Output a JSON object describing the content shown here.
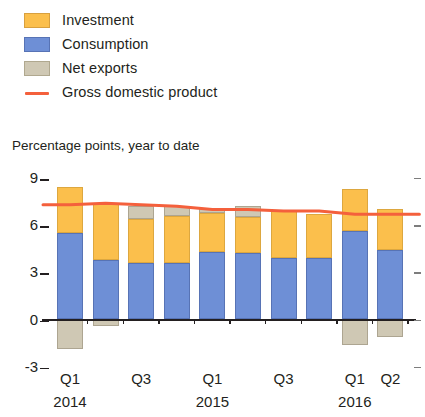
{
  "legend": {
    "items": [
      {
        "label": "Investment",
        "type": "swatch",
        "color": "#fbbf4c",
        "icon": "square-swatch-icon"
      },
      {
        "label": "Consumption",
        "type": "swatch",
        "color": "#6e8fd6",
        "icon": "square-swatch-icon"
      },
      {
        "label": "Net exports",
        "type": "swatch",
        "color": "#cfc8b4",
        "icon": "square-swatch-icon"
      },
      {
        "label": "Gross domestic product",
        "type": "line",
        "color": "#f4603c",
        "icon": "line-swatch-icon"
      }
    ]
  },
  "chart_data": {
    "type": "bar",
    "stacked": true,
    "title": "",
    "subtitle": "",
    "ylabel": "Percentage points, year to date",
    "xlabel": "",
    "ylim": [
      -3,
      9
    ],
    "yticks": [
      9,
      6,
      3,
      0,
      -3
    ],
    "ytick_labels": [
      "9",
      "6",
      "3",
      "0",
      "-3"
    ],
    "grid": false,
    "legend_position": "top-left",
    "categories": [
      "Q1",
      "Q2",
      "Q3",
      "Q4",
      "Q1",
      "Q2",
      "Q3",
      "Q4",
      "Q1",
      "Q2"
    ],
    "x_tick_labels": [
      "Q1",
      "Q3",
      "Q1",
      "Q3",
      "Q1",
      "Q2"
    ],
    "x_tick_indices": [
      0,
      2,
      4,
      6,
      8,
      9
    ],
    "year_labels": [
      "2014",
      "2015",
      "2016"
    ],
    "year_label_indices": [
      0,
      4,
      8
    ],
    "series": [
      {
        "name": "Consumption",
        "color": "#6e8fd6",
        "values": [
          5.5,
          3.8,
          3.6,
          3.6,
          4.3,
          4.2,
          3.9,
          3.9,
          5.6,
          4.4
        ]
      },
      {
        "name": "Investment",
        "color": "#fbbf4c",
        "values": [
          2.9,
          3.6,
          2.8,
          3.0,
          2.5,
          2.3,
          3.0,
          2.8,
          2.7,
          2.6
        ]
      },
      {
        "name": "Net exports",
        "color": "#cfc8b4",
        "values": [
          -1.9,
          -0.4,
          0.8,
          0.6,
          0.3,
          0.7,
          0.0,
          0.0,
          -1.6,
          -1.1
        ]
      }
    ],
    "line_series": {
      "name": "Gross domestic product",
      "color": "#f4603c",
      "values": [
        7.3,
        7.4,
        7.3,
        7.2,
        7.0,
        7.0,
        6.9,
        6.9,
        6.7,
        6.7
      ]
    }
  },
  "colors": {
    "investment": "#fbbf4c",
    "consumption": "#6e8fd6",
    "net_exports": "#cfc8b4",
    "gdp_line": "#f4603c",
    "axis": "#231f20",
    "background": "#ffffff"
  }
}
